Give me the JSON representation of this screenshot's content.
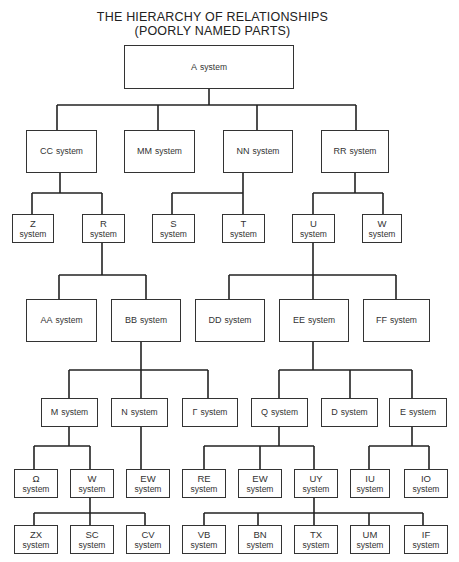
{
  "title": {
    "line1": "THE HIERARCHY OF RELATIONSHIPS",
    "line2": "(POORLY NAMED PARTS)"
  },
  "nodes": {
    "A": {
      "code": "A",
      "suffix": "system"
    },
    "CC": {
      "code": "CC",
      "suffix": "system"
    },
    "MM": {
      "code": "MM",
      "suffix": "system"
    },
    "NN": {
      "code": "NN",
      "suffix": "system"
    },
    "RR": {
      "code": "RR",
      "suffix": "system"
    },
    "Z": {
      "code": "Z",
      "suffix": "system"
    },
    "R": {
      "code": "R",
      "suffix": "system"
    },
    "S": {
      "code": "S",
      "suffix": "system"
    },
    "T": {
      "code": "T",
      "suffix": "system"
    },
    "U": {
      "code": "U",
      "suffix": "system"
    },
    "W1": {
      "code": "W",
      "suffix": "system"
    },
    "AA": {
      "code": "AA",
      "suffix": "system"
    },
    "BB": {
      "code": "BB",
      "suffix": "system"
    },
    "DD": {
      "code": "DD",
      "suffix": "system"
    },
    "EE": {
      "code": "EE",
      "suffix": "system"
    },
    "FF": {
      "code": "FF",
      "suffix": "system"
    },
    "M": {
      "code": "M",
      "suffix": "system"
    },
    "N": {
      "code": "N",
      "suffix": "system"
    },
    "P": {
      "code": "Γ",
      "suffix": "system"
    },
    "Q": {
      "code": "Q",
      "suffix": "system"
    },
    "D": {
      "code": "D",
      "suffix": "system"
    },
    "E": {
      "code": "E",
      "suffix": "system"
    },
    "O": {
      "code": "Ω",
      "suffix": "system"
    },
    "W2": {
      "code": "W",
      "suffix": "system"
    },
    "EW1": {
      "code": "EW",
      "suffix": "system"
    },
    "RE": {
      "code": "RE",
      "suffix": "system"
    },
    "EW2": {
      "code": "EW",
      "suffix": "system"
    },
    "UY": {
      "code": "UY",
      "suffix": "system"
    },
    "IU": {
      "code": "IU",
      "suffix": "system"
    },
    "IO": {
      "code": "IO",
      "suffix": "system"
    },
    "ZX": {
      "code": "ZX",
      "suffix": "system"
    },
    "SC": {
      "code": "SC",
      "suffix": "system"
    },
    "CV": {
      "code": "CV",
      "suffix": "system"
    },
    "VB": {
      "code": "VB",
      "suffix": "system"
    },
    "BN": {
      "code": "BN",
      "suffix": "system"
    },
    "TX": {
      "code": "TX",
      "suffix": "system"
    },
    "UM": {
      "code": "UM",
      "suffix": "system"
    },
    "IF": {
      "code": "IF",
      "suffix": "system"
    }
  },
  "edges": [
    [
      "A",
      "CC"
    ],
    [
      "A",
      "MM"
    ],
    [
      "A",
      "NN"
    ],
    [
      "A",
      "RR"
    ],
    [
      "CC",
      "Z"
    ],
    [
      "CC",
      "R"
    ],
    [
      "NN",
      "S"
    ],
    [
      "NN",
      "T"
    ],
    [
      "RR",
      "U"
    ],
    [
      "RR",
      "W1"
    ],
    [
      "R",
      "AA"
    ],
    [
      "R",
      "BB"
    ],
    [
      "U",
      "DD"
    ],
    [
      "U",
      "EE"
    ],
    [
      "U",
      "FF"
    ],
    [
      "BB",
      "M"
    ],
    [
      "BB",
      "N"
    ],
    [
      "BB",
      "P"
    ],
    [
      "EE",
      "Q"
    ],
    [
      "EE",
      "D"
    ],
    [
      "EE",
      "E"
    ],
    [
      "M",
      "O"
    ],
    [
      "M",
      "W2"
    ],
    [
      "N",
      "EW1"
    ],
    [
      "Q",
      "RE"
    ],
    [
      "Q",
      "EW2"
    ],
    [
      "Q",
      "UY"
    ],
    [
      "E",
      "IU"
    ],
    [
      "E",
      "IO"
    ],
    [
      "W2",
      "ZX"
    ],
    [
      "W2",
      "SC"
    ],
    [
      "W2",
      "CV"
    ],
    [
      "UY",
      "VB"
    ],
    [
      "UY",
      "BN"
    ],
    [
      "UY",
      "TX"
    ],
    [
      "UY",
      "UM"
    ],
    [
      "UY",
      "IF"
    ]
  ]
}
